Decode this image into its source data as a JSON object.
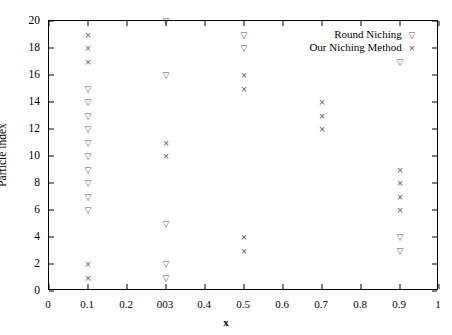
{
  "chart_data": {
    "type": "scatter",
    "title": "",
    "xlabel": "x",
    "ylabel": "Particle index",
    "xlim": [
      0,
      1
    ],
    "ylim": [
      0,
      20
    ],
    "grid": false,
    "legend_position": "top-right",
    "x_ticks": [
      {
        "value": 0,
        "label": "0"
      },
      {
        "value": 0.1,
        "label": "0.1"
      },
      {
        "value": 0.2,
        "label": "0.2"
      },
      {
        "value": 0.3,
        "label": "003"
      },
      {
        "value": 0.4,
        "label": "0.4"
      },
      {
        "value": 0.5,
        "label": "0.5"
      },
      {
        "value": 0.6,
        "label": "0.6"
      },
      {
        "value": 0.7,
        "label": "0.7"
      },
      {
        "value": 0.8,
        "label": "0.8"
      },
      {
        "value": 0.9,
        "label": "0.9"
      },
      {
        "value": 1.0,
        "label": "1"
      }
    ],
    "y_ticks": [
      {
        "value": 0,
        "label": "0"
      },
      {
        "value": 2,
        "label": "2"
      },
      {
        "value": 4,
        "label": "4"
      },
      {
        "value": 6,
        "label": "6"
      },
      {
        "value": 8,
        "label": "8"
      },
      {
        "value": 10,
        "label": "10"
      },
      {
        "value": 12,
        "label": "12"
      },
      {
        "value": 14,
        "label": "14"
      },
      {
        "value": 16,
        "label": "16"
      },
      {
        "value": 18,
        "label": "18"
      },
      {
        "value": 20,
        "label": "20"
      }
    ],
    "series": [
      {
        "name": "Round Niching",
        "marker": "triangle-down",
        "color": "#555555",
        "points": [
          {
            "x": 0.1,
            "y": 15
          },
          {
            "x": 0.1,
            "y": 14
          },
          {
            "x": 0.1,
            "y": 13
          },
          {
            "x": 0.1,
            "y": 12
          },
          {
            "x": 0.1,
            "y": 11
          },
          {
            "x": 0.1,
            "y": 10
          },
          {
            "x": 0.1,
            "y": 9
          },
          {
            "x": 0.1,
            "y": 8
          },
          {
            "x": 0.1,
            "y": 7
          },
          {
            "x": 0.1,
            "y": 6
          },
          {
            "x": 0.3,
            "y": 20
          },
          {
            "x": 0.3,
            "y": 16
          },
          {
            "x": 0.3,
            "y": 5
          },
          {
            "x": 0.3,
            "y": 2
          },
          {
            "x": 0.3,
            "y": 1
          },
          {
            "x": 0.5,
            "y": 19
          },
          {
            "x": 0.5,
            "y": 18
          },
          {
            "x": 0.9,
            "y": 17
          },
          {
            "x": 0.9,
            "y": 4
          },
          {
            "x": 0.9,
            "y": 3
          }
        ]
      },
      {
        "name": "Our Niching Method",
        "marker": "cross",
        "color": "#555555",
        "points": [
          {
            "x": 0.1,
            "y": 19
          },
          {
            "x": 0.1,
            "y": 18
          },
          {
            "x": 0.1,
            "y": 17
          },
          {
            "x": 0.1,
            "y": 2
          },
          {
            "x": 0.1,
            "y": 1
          },
          {
            "x": 0.3,
            "y": 11
          },
          {
            "x": 0.3,
            "y": 10
          },
          {
            "x": 0.5,
            "y": 16
          },
          {
            "x": 0.5,
            "y": 15
          },
          {
            "x": 0.5,
            "y": 4
          },
          {
            "x": 0.5,
            "y": 3
          },
          {
            "x": 0.7,
            "y": 14
          },
          {
            "x": 0.7,
            "y": 13
          },
          {
            "x": 0.7,
            "y": 12
          },
          {
            "x": 0.9,
            "y": 9
          },
          {
            "x": 0.9,
            "y": 8
          },
          {
            "x": 0.9,
            "y": 7
          },
          {
            "x": 0.9,
            "y": 6
          }
        ]
      }
    ],
    "legend": [
      {
        "label": "Round Niching",
        "marker": "triangle-down",
        "sample_x": 0.93,
        "sample_y": 19
      },
      {
        "label": "Our Niching Method",
        "marker": "cross",
        "sample_x": 0.93,
        "sample_y": 18
      }
    ]
  },
  "glyphs": {
    "triangle_down": "▽",
    "cross": "×"
  }
}
